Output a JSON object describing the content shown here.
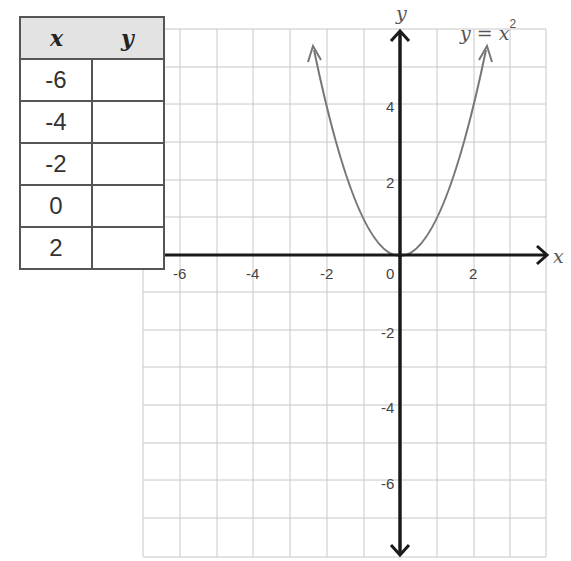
{
  "table": {
    "headers": [
      "x",
      "y"
    ],
    "rows": [
      {
        "x": "-6",
        "y": ""
      },
      {
        "x": "-4",
        "y": ""
      },
      {
        "x": "-2",
        "y": ""
      },
      {
        "x": "0",
        "y": ""
      },
      {
        "x": "2",
        "y": ""
      }
    ]
  },
  "graph": {
    "x_axis_label": "x",
    "y_axis_label": "y",
    "equation": "y = x",
    "equation_exponent": "2",
    "x_ticks": [
      "-6",
      "-4",
      "-2",
      "0",
      "2"
    ],
    "y_ticks": [
      "4",
      "2",
      "-2",
      "-4",
      "-6"
    ],
    "colors": {
      "grid": "#c8c8c8",
      "axes": "#1a1a1a",
      "curve": "#777777"
    }
  }
}
